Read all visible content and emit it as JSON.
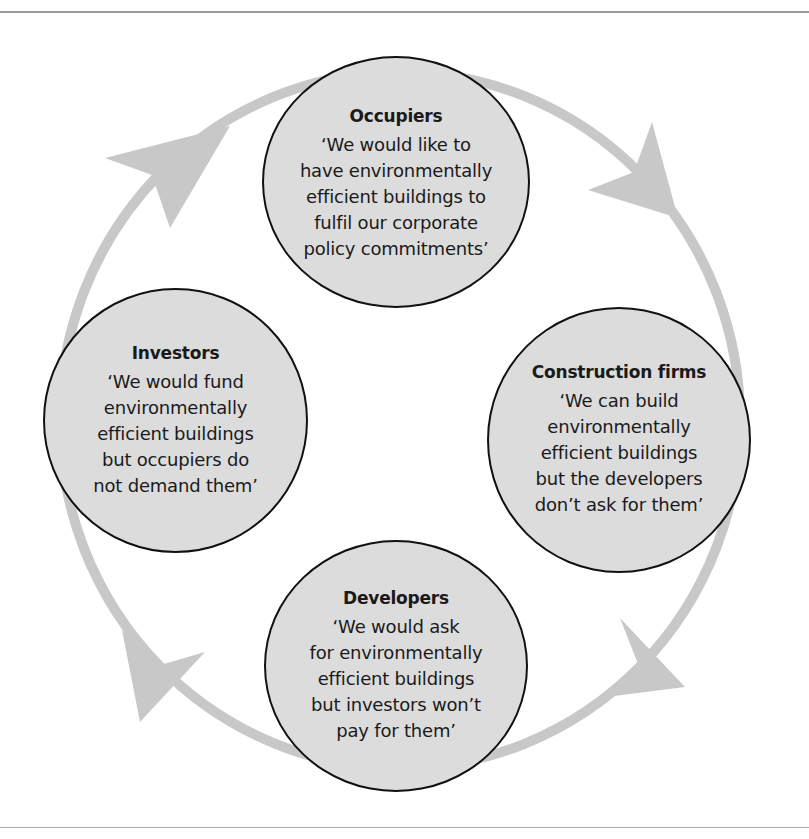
{
  "diagram": {
    "type": "cycle",
    "direction": "clockwise",
    "colors": {
      "node_fill": "#dcdcdc",
      "node_border": "#111111",
      "ring": "#c8c8c8",
      "text": "#1a1a1a"
    },
    "nodes": [
      {
        "id": "occupiers",
        "title": "Occupiers",
        "quote_lines": [
          "‘We would like to",
          "have environmentally",
          "efficient buildings to",
          "fulfil our corporate",
          "policy commitments’"
        ]
      },
      {
        "id": "construction",
        "title": "Construction firms",
        "quote_lines": [
          "‘We can build",
          "environmentally",
          "efficient buildings",
          "but the developers",
          "don’t ask for them’"
        ]
      },
      {
        "id": "developers",
        "title": "Developers",
        "quote_lines": [
          "‘We would ask",
          "for environmentally",
          "efficient buildings",
          "but investors won’t",
          "pay for them’"
        ]
      },
      {
        "id": "investors",
        "title": "Investors",
        "quote_lines": [
          "‘We would fund",
          "environmentally",
          "efficient buildings",
          "but occupiers do",
          "not demand them’"
        ]
      }
    ],
    "arrows": [
      {
        "from": "investors",
        "to": "occupiers",
        "icon": "arrowhead-icon"
      },
      {
        "from": "occupiers",
        "to": "construction",
        "icon": "arrowhead-icon"
      },
      {
        "from": "construction",
        "to": "developers",
        "icon": "arrowhead-icon"
      },
      {
        "from": "developers",
        "to": "investors",
        "icon": "arrowhead-icon"
      }
    ]
  }
}
